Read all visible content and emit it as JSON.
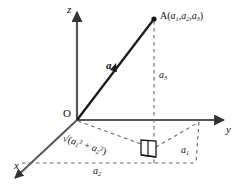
{
  "figure": {
    "kind": "3d-vector-coordinate-diagram",
    "background_color": "#ffffff",
    "stroke_color": "#1a1a1a",
    "axis_color": "#555555",
    "dashed_color": "#666666"
  },
  "axes": {
    "x_label": "x",
    "y_label": "y",
    "z_label": "z",
    "origin_label": "O"
  },
  "vector": {
    "label": "a",
    "tail": "O",
    "head": "A"
  },
  "point": {
    "name": "A",
    "coords_open": "(",
    "coords_close": ")",
    "c1_base": "a",
    "c1_sub": "1",
    "sep1": ",",
    "c2_base": "a",
    "c2_sub": "2",
    "sep2": ",",
    "c3_base": "a",
    "c3_sub": "3"
  },
  "components": {
    "a1_base": "a",
    "a1_sub": "1",
    "a2_base": "a",
    "a2_sub": "2",
    "a3_base": "a",
    "a3_sub": "3"
  },
  "projection_length": {
    "radical": "√",
    "open": "(",
    "term1_base": "a",
    "term1_sub": "1",
    "term1_sup": "2",
    "plus": "+",
    "term2_base": "a",
    "term2_sub": "2",
    "term2_sup": "2",
    "close": ")"
  },
  "markers": {
    "right_angle": "right-angle-marker",
    "point_dot": "filled-dot"
  }
}
